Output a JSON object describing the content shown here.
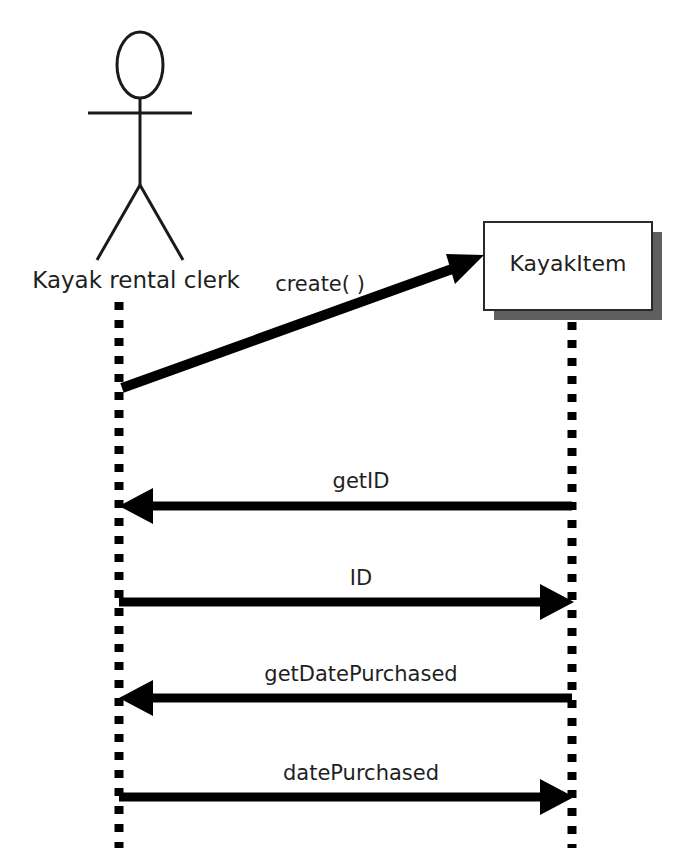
{
  "diagram": {
    "type": "uml-sequence-diagram",
    "background_color": "#ffffff",
    "line_color": "#000000",
    "text_color": "#1f1f1f",
    "shadow_color": "#5f5f5f"
  },
  "participants": [
    {
      "id": "actor",
      "kind": "actor",
      "label": "Kayak rental clerk",
      "lifeline_x": 119,
      "label_center_x": 136,
      "label_y": 278
    },
    {
      "id": "kayakitem",
      "kind": "object",
      "label": "KayakItem",
      "lifeline_x": 572,
      "label_center_x": 568,
      "label_y": 264,
      "box": {
        "x": 484,
        "y": 222,
        "width": 168,
        "height": 88
      },
      "shadow_offset": 10
    }
  ],
  "messages": [
    {
      "id": "msg-create",
      "label": "create( )",
      "direction": "actor-to-object",
      "style": "diagonal",
      "from_x": 122,
      "from_y": 388,
      "to_x": 482,
      "to_y": 258,
      "label_center_x": 320,
      "label_y": 282
    },
    {
      "id": "msg-getid",
      "label": "getID",
      "direction": "object-to-actor",
      "style": "horizontal",
      "y": 506,
      "label_center_x": 361,
      "label_y": 479
    },
    {
      "id": "msg-id",
      "label": "ID",
      "direction": "actor-to-object",
      "style": "horizontal",
      "y": 602,
      "label_center_x": 361,
      "label_y": 576
    },
    {
      "id": "msg-getdatepurchased",
      "label": "getDatePurchased",
      "direction": "object-to-actor",
      "style": "horizontal",
      "y": 698,
      "label_center_x": 361,
      "label_y": 672
    },
    {
      "id": "msg-datepurchased",
      "label": "datePurchased",
      "direction": "actor-to-object",
      "style": "horizontal",
      "y": 797,
      "label_center_x": 361,
      "label_y": 771
    }
  ],
  "lifelines": {
    "dash_size": 8,
    "dash_gap": 10,
    "actor_top": 300,
    "actor_bottom": 848,
    "object_top": 318,
    "object_bottom": 848
  }
}
